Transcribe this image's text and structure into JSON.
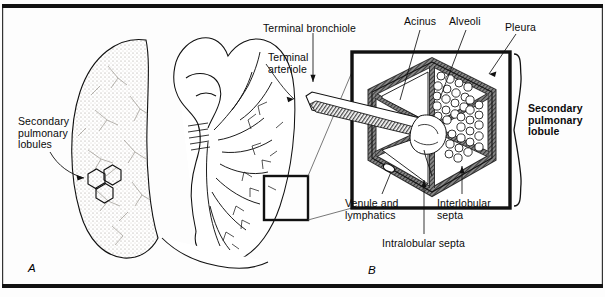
{
  "figure": {
    "panels": {
      "a": "A",
      "b": "B"
    },
    "labels": [
      {
        "id": "secondary-pulmonary-lobules",
        "text": [
          "Secondary",
          "pulmonary",
          "lobules"
        ],
        "x": 18,
        "y": 116,
        "bold": false
      },
      {
        "id": "terminal-bronchiole",
        "text": [
          "Terminal bronchiole"
        ],
        "x": 263,
        "y": 23,
        "bold": false
      },
      {
        "id": "terminal-arteriole",
        "text": [
          "Terminal",
          "arteriole"
        ],
        "x": 268,
        "y": 52,
        "bold": false
      },
      {
        "id": "acinus",
        "text": [
          "Acinus"
        ],
        "x": 404,
        "y": 16,
        "bold": false
      },
      {
        "id": "alveoli",
        "text": [
          "Alveoli"
        ],
        "x": 449,
        "y": 16,
        "bold": false
      },
      {
        "id": "pleura",
        "text": [
          "Pleura"
        ],
        "x": 505,
        "y": 22,
        "bold": false
      },
      {
        "id": "secondary-pulmonary-lobule",
        "text": [
          "Secondary",
          "pulmonary",
          "lobule"
        ],
        "x": 528,
        "y": 103,
        "bold": true
      },
      {
        "id": "venule-and-lymphatics",
        "text": [
          "Venule and",
          "lymphatics"
        ],
        "x": 345,
        "y": 198,
        "bold": false
      },
      {
        "id": "interlobular-septa",
        "text": [
          "Interlobular",
          "septa"
        ],
        "x": 437,
        "y": 198,
        "bold": false
      },
      {
        "id": "intralobular-septa",
        "text": [
          "Intralobular septa"
        ],
        "x": 382,
        "y": 238,
        "bold": false
      }
    ],
    "colors": {
      "ink": "#000000",
      "septa_fill": "#777777",
      "lobule_interior": "#ffffff",
      "lung_stipple": "#b9b4ad",
      "background": "#fdfdfd"
    }
  }
}
